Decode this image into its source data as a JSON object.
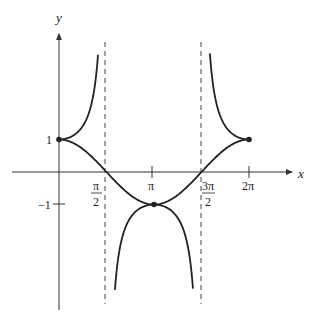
{
  "chart_data": {
    "type": "line",
    "title": "",
    "xlabel": "x",
    "ylabel": "y",
    "x_ticks": [
      "π/2",
      "π",
      "3π/2",
      "2π"
    ],
    "y_ticks": [
      "1",
      "-1"
    ],
    "xlim": [
      0,
      6.2832
    ],
    "ylim": [
      -3.6,
      3.6
    ],
    "grid": false,
    "asymptotes": [
      {
        "x": 1.5708,
        "style": "dashed"
      },
      {
        "x": 4.7124,
        "style": "dashed"
      }
    ],
    "series": [
      {
        "name": "y = cos x",
        "domain": [
          0,
          6.2832
        ],
        "points": [
          [
            0,
            1
          ],
          [
            1.5708,
            0
          ],
          [
            3.1416,
            -1
          ],
          [
            4.7124,
            0
          ],
          [
            6.2832,
            1
          ]
        ]
      },
      {
        "name": "y = sec x",
        "domain": [
          [
            0,
            1.29
          ],
          [
            1.85,
            4.43
          ],
          [
            4.99,
            6.2832
          ]
        ],
        "points": [
          [
            0,
            1
          ],
          [
            3.1416,
            -1
          ],
          [
            6.2832,
            1
          ]
        ]
      }
    ],
    "marked_points": [
      [
        0,
        1
      ],
      [
        3.1416,
        -1
      ],
      [
        6.2832,
        1
      ]
    ]
  },
  "labels": {
    "x_axis": "x",
    "y_axis": "y",
    "tick_pi_half_num": "π",
    "tick_pi_half_den": "2",
    "tick_pi": "π",
    "tick_3pi_half_num": "3π",
    "tick_3pi_half_den": "2",
    "tick_2pi": "2π",
    "tick_y_1": "1",
    "tick_y_neg1": "−1"
  }
}
